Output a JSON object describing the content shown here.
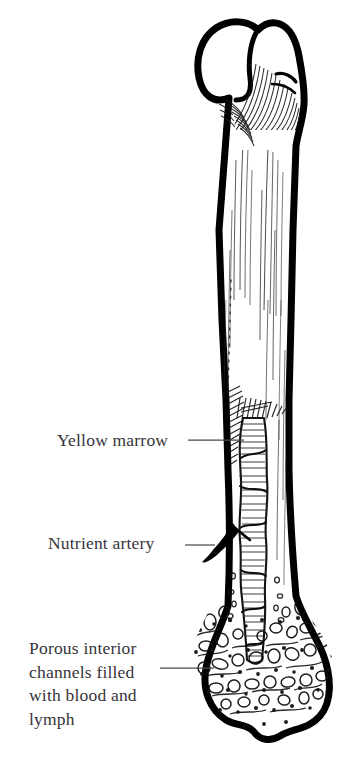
{
  "figure": {
    "background_color": "#ffffff",
    "ink_color": "#000000",
    "text_color": "#37343a",
    "leader_color": "#4a4a4a"
  },
  "labels": {
    "yellow_marrow": "Yellow marrow",
    "nutrient_artery": "Nutrient artery",
    "porous_interior": "Porous interior\nchannels filled\nwith blood and\nlymph"
  },
  "anatomy": {
    "proximal_head": "head",
    "greater_trochanter": "greater trochanter",
    "shaft": "diaphysis",
    "marrow_cavity": "medullary cavity",
    "distal_condyles": "condyles",
    "spongy_bone": "trabecular bone"
  }
}
